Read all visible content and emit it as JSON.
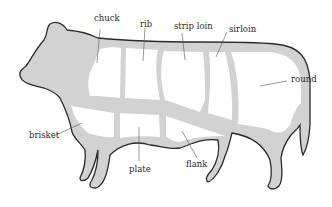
{
  "diagram": {
    "colors": {
      "body_fill": "#d2d2d2",
      "outline": "#2b2b2b",
      "cut_fill": "#ffffff",
      "leader": "#555555",
      "text": "#2a2a2a"
    },
    "labels": {
      "chuck": "chuck",
      "rib": "rib",
      "strip_loin": "strip loin",
      "sirloin": "sirloin",
      "round": "round",
      "brisket": "brisket",
      "plate": "plate",
      "flank": "flank"
    }
  }
}
